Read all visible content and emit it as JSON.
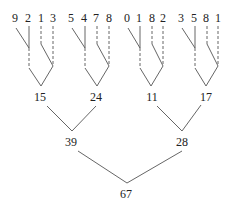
{
  "diagram": {
    "type": "sum-tree",
    "groups": [
      {
        "digits": [
          "9",
          "2",
          "1",
          "3"
        ],
        "sum": "15"
      },
      {
        "digits": [
          "5",
          "4",
          "7",
          "8"
        ],
        "sum": "24"
      },
      {
        "digits": [
          "0",
          "1",
          "8",
          "2"
        ],
        "sum": "11"
      },
      {
        "digits": [
          "3",
          "5",
          "8",
          "1"
        ],
        "sum": "17"
      }
    ],
    "level2": [
      "39",
      "28"
    ],
    "root": "67",
    "colors": {
      "line": "#555555",
      "text": "#222222",
      "background": "#ffffff"
    }
  }
}
